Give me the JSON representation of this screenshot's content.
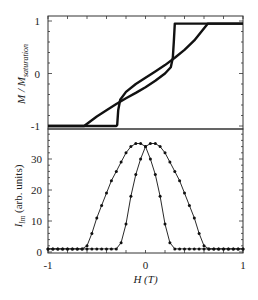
{
  "figure": {
    "xlabel": "H (T)",
    "top_ylabel_main": "M / M",
    "top_ylabel_sub": "saturation",
    "bottom_ylabel_main": "I",
    "bottom_ylabel_sub": "lm",
    "bottom_ylabel_rest": " (arb. units)",
    "line_color": "#111111"
  },
  "chart_data": [
    {
      "type": "line",
      "title": "",
      "panel": "top",
      "xlabel": "H (T)",
      "ylabel": "M/M_saturation",
      "xlim": [
        -1,
        1
      ],
      "ylim": [
        -1,
        1
      ],
      "xticks": [
        -1,
        0,
        1
      ],
      "yticks": [
        -1,
        0,
        1
      ],
      "grid": false,
      "legend": null,
      "series": [
        {
          "name": "branch-A (smooth at negative field, sharp switch at +0.29 T)",
          "x": [
            -1.0,
            -0.63,
            -0.5,
            -0.4,
            -0.3,
            -0.2,
            -0.1,
            0.0,
            0.1,
            0.2,
            0.26,
            0.28,
            0.29,
            0.3,
            1.0
          ],
          "y": [
            -1.0,
            -1.0,
            -0.82,
            -0.7,
            -0.58,
            -0.47,
            -0.37,
            -0.26,
            -0.14,
            0.0,
            0.12,
            0.3,
            0.6,
            0.95,
            0.95
          ]
        },
        {
          "name": "branch-B (sharp switch at -0.29 T, smooth at positive field)",
          "x": [
            -1.0,
            -0.3,
            -0.29,
            -0.28,
            -0.26,
            -0.2,
            -0.1,
            0.0,
            0.1,
            0.2,
            0.3,
            0.4,
            0.5,
            0.64,
            1.0
          ],
          "y": [
            -1.0,
            -1.0,
            -0.98,
            -0.7,
            -0.5,
            -0.35,
            -0.2,
            -0.08,
            0.04,
            0.16,
            0.3,
            0.45,
            0.63,
            0.95,
            0.95
          ]
        }
      ]
    },
    {
      "type": "line",
      "title": "",
      "panel": "bottom",
      "xlabel": "H (T)",
      "ylabel": "I_lm (arb. units)",
      "xlim": [
        -1,
        1
      ],
      "ylim": [
        0,
        39
      ],
      "xticks": [
        -1,
        0,
        1
      ],
      "yticks": [
        0,
        10,
        20,
        30
      ],
      "grid": false,
      "legend": null,
      "markers": true,
      "series": [
        {
          "name": "peak-left",
          "x": [
            -1.0,
            -0.95,
            -0.9,
            -0.85,
            -0.8,
            -0.75,
            -0.7,
            -0.65,
            -0.6,
            -0.55,
            -0.5,
            -0.45,
            -0.4,
            -0.35,
            -0.3,
            -0.25,
            -0.2,
            -0.15,
            -0.1,
            -0.05,
            0.0,
            0.05,
            0.1,
            0.15,
            0.2,
            0.25,
            0.3,
            0.35,
            0.4,
            0.45,
            0.5,
            0.55,
            0.6,
            0.65,
            0.7,
            0.75,
            0.8,
            0.85,
            0.9,
            0.95,
            1.0
          ],
          "y": [
            1,
            1,
            1,
            1,
            1,
            1,
            1,
            1,
            2,
            6,
            11,
            15,
            19,
            23,
            26,
            29,
            32,
            34,
            35,
            35,
            34,
            30,
            25,
            18,
            9,
            3,
            1,
            1,
            1,
            1,
            1,
            1,
            1,
            1,
            1,
            1,
            1,
            1,
            1,
            1,
            1
          ]
        },
        {
          "name": "peak-right",
          "x": [
            -1.0,
            -0.95,
            -0.9,
            -0.85,
            -0.8,
            -0.75,
            -0.7,
            -0.65,
            -0.6,
            -0.55,
            -0.5,
            -0.45,
            -0.4,
            -0.35,
            -0.3,
            -0.25,
            -0.2,
            -0.15,
            -0.1,
            -0.05,
            0.0,
            0.05,
            0.1,
            0.15,
            0.2,
            0.25,
            0.3,
            0.35,
            0.4,
            0.45,
            0.5,
            0.55,
            0.6,
            0.65,
            0.7,
            0.75,
            0.8,
            0.85,
            0.9,
            0.95,
            1.0
          ],
          "y": [
            1,
            1,
            1,
            1,
            1,
            1,
            1,
            1,
            1,
            1,
            1,
            1,
            1,
            1,
            1,
            3,
            9,
            18,
            25,
            30,
            34,
            35,
            35,
            34,
            32,
            29,
            26,
            23,
            19,
            15,
            11,
            6,
            2,
            1,
            1,
            1,
            1,
            1,
            1,
            1,
            1
          ]
        }
      ]
    }
  ]
}
